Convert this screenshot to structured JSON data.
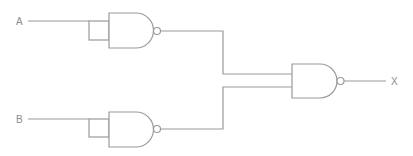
{
  "diagram": {
    "type": "logic-circuit",
    "stroke_color": "#9a9a9a",
    "label_color": "#8c8c8c",
    "inputs": [
      {
        "label": "A"
      },
      {
        "label": "B"
      }
    ],
    "outputs": [
      {
        "label": "X"
      }
    ],
    "gates": [
      {
        "id": "nand-1",
        "type": "NAND",
        "inputs": [
          "A",
          "A"
        ],
        "output": "n1",
        "note": "inputs tied together (inverter)"
      },
      {
        "id": "nand-2",
        "type": "NAND",
        "inputs": [
          "B",
          "B"
        ],
        "output": "n2",
        "note": "inputs tied together (inverter)"
      },
      {
        "id": "nand-3",
        "type": "NAND",
        "inputs": [
          "n1",
          "n2"
        ],
        "output": "X"
      }
    ]
  }
}
